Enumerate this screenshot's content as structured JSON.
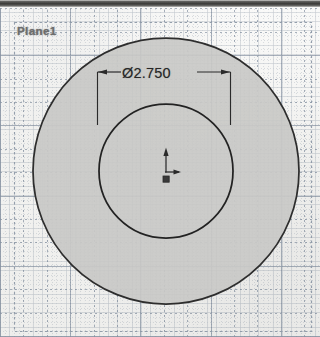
{
  "app": {
    "kind": "cad-sketch-view",
    "width": 320,
    "height": 337
  },
  "sketch": {
    "plane_label": "Plane1",
    "plane_boundary": {
      "x": 14,
      "y": 22,
      "width": 298,
      "height": 310,
      "style": "dashed",
      "color": "#8e9aa8"
    },
    "origin": {
      "name": "sketch-origin",
      "x": 166,
      "y": 171,
      "axis_color": "#2b2b2b"
    },
    "circles": [
      {
        "name": "outer-circle",
        "cx": 166,
        "cy": 171,
        "r": 133,
        "fill": "#c9c9c7",
        "stroke": "#2e2e2e",
        "stroke_width": 1.7
      },
      {
        "name": "inner-circle",
        "cx": 166,
        "cy": 171,
        "r": 67,
        "fill": "none",
        "stroke": "#232323",
        "stroke_width": 1.7
      }
    ],
    "dimension": {
      "name": "diameter-dimension",
      "value": "Ø2.750",
      "numeric_value": 2.75,
      "symbol": "Ø",
      "line_y": 72,
      "left_x": 97,
      "right_x": 230,
      "text_x": 122,
      "text_y": 65,
      "color": "#272727"
    }
  },
  "colors": {
    "paper": "#f3f3f1",
    "grid_major": "#607086",
    "grid_minor": "#768496",
    "shaded_region": "#c9c9c7",
    "outline": "#2e2e2e",
    "label_text": "#6d6d6d",
    "top_band": "#3a3a38"
  }
}
